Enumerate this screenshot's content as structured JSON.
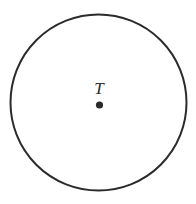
{
  "figure": {
    "type": "geometry-diagram",
    "background_color": "#ffffff",
    "stroke_color": "#2b2b2b",
    "circle": {
      "name": "circle-outline",
      "center_x": 98.5,
      "center_y": 102.5,
      "radius": 88,
      "stroke_width": 2,
      "fill": "none"
    },
    "center_point": {
      "name": "center-point",
      "label": "T",
      "x": 99.5,
      "y": 105,
      "radius": 3.6,
      "fill_color": "#2b2b2b"
    },
    "label": {
      "text": "T",
      "x": 99,
      "y": 94,
      "color": "#2b2b2b",
      "style": "italic-serif"
    }
  }
}
